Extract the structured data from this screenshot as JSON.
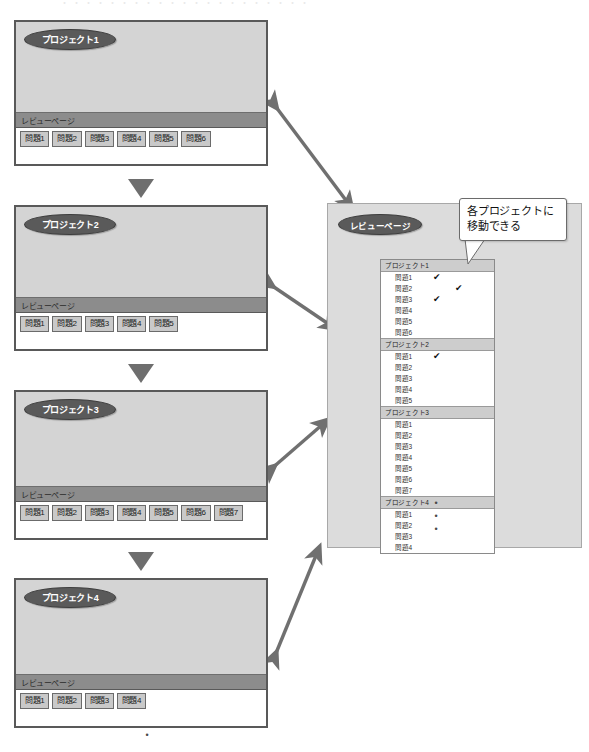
{
  "header": {
    "cropped_text": "・・・・・・・・・・・・・・・・・・・・・"
  },
  "projects": [
    {
      "title": "プロジェクト1",
      "review_label": "レビューページ",
      "questions": [
        "問題1",
        "問題2",
        "問題3",
        "問題4",
        "問題5",
        "問題6"
      ]
    },
    {
      "title": "プロジェクト2",
      "review_label": "レビューページ",
      "questions": [
        "問題1",
        "問題2",
        "問題3",
        "問題4",
        "問題5"
      ]
    },
    {
      "title": "プロジェクト3",
      "review_label": "レビューページ",
      "questions": [
        "問題1",
        "問題2",
        "問題3",
        "問題4",
        "問題5",
        "問題6",
        "問題7"
      ]
    },
    {
      "title": "プロジェクト4",
      "review_label": "レビューページ",
      "questions": [
        "問題1",
        "問題2",
        "問題3",
        "問題4"
      ]
    }
  ],
  "review_panel": {
    "title": "レビューページ",
    "groups": [
      {
        "label": "プロジェクト1",
        "items": [
          {
            "label": "問題1",
            "check_col1": true,
            "check_col2": false
          },
          {
            "label": "問題2",
            "check_col1": false,
            "check_col2": true
          },
          {
            "label": "問題3",
            "check_col1": true,
            "check_col2": false
          },
          {
            "label": "問題4",
            "check_col1": false,
            "check_col2": false
          },
          {
            "label": "問題5",
            "check_col1": false,
            "check_col2": false
          },
          {
            "label": "問題6",
            "check_col1": false,
            "check_col2": false
          }
        ]
      },
      {
        "label": "プロジェクト2",
        "items": [
          {
            "label": "問題1",
            "check_col1": true,
            "check_col2": false
          },
          {
            "label": "問題2",
            "check_col1": false,
            "check_col2": false
          },
          {
            "label": "問題3",
            "check_col1": false,
            "check_col2": false
          },
          {
            "label": "問題4",
            "check_col1": false,
            "check_col2": false
          },
          {
            "label": "問題5",
            "check_col1": false,
            "check_col2": false
          }
        ]
      },
      {
        "label": "プロジェクト3",
        "items": [
          {
            "label": "問題1",
            "check_col1": false,
            "check_col2": false
          },
          {
            "label": "問題2",
            "check_col1": false,
            "check_col2": false
          },
          {
            "label": "問題3",
            "check_col1": false,
            "check_col2": false
          },
          {
            "label": "問題4",
            "check_col1": false,
            "check_col2": false
          },
          {
            "label": "問題5",
            "check_col1": false,
            "check_col2": false
          },
          {
            "label": "問題6",
            "check_col1": false,
            "check_col2": false
          },
          {
            "label": "問題7",
            "check_col1": false,
            "check_col2": false
          }
        ]
      },
      {
        "label": "プロジェクト4",
        "items": [
          {
            "label": "問題1",
            "check_col1": false,
            "check_col2": false
          },
          {
            "label": "問題2",
            "check_col1": false,
            "check_col2": false
          },
          {
            "label": "問題3",
            "check_col1": false,
            "check_col2": false
          },
          {
            "label": "問題4",
            "check_col1": false,
            "check_col2": false
          }
        ]
      }
    ],
    "continuation_dots": [
      "•",
      "•",
      "•"
    ]
  },
  "callout": {
    "line1": "各プロジェクトに",
    "line2": "移動できる"
  },
  "bottom_continuation": "•",
  "check_glyph": "✔",
  "colors": {
    "card_fill": "#d4d4d4",
    "card_border": "#595959",
    "badge_fill": "#5a5a5a",
    "strip_fill": "#8c8c8c",
    "button_fill": "#c9c9c9",
    "panel_fill": "#dcdcdc",
    "arrow_fill": "#707070"
  }
}
